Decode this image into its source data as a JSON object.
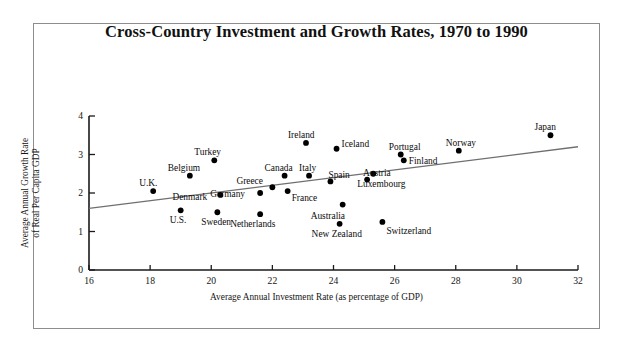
{
  "figure": {
    "title": "Cross-Country Investment and Growth Rates, 1970 to 1990"
  },
  "chart_data": {
    "type": "scatter",
    "title": "Cross-Country Investment and Growth Rates, 1970 to 1990",
    "xlabel": "Average Annual Investment Rate (as percentage of GDP)",
    "ylabel": "Average Annual Growth Rate of Real Per Capita GDP",
    "ylabel_line1": "Average Annual Growth Rate",
    "ylabel_line2": "of Real Per Capita GDP",
    "xlim": [
      16,
      32
    ],
    "ylim": [
      0,
      4
    ],
    "xticks": [
      16,
      18,
      20,
      22,
      24,
      26,
      28,
      30,
      32
    ],
    "yticks": [
      0,
      1,
      2,
      3,
      4
    ],
    "grid": false,
    "legend": "none",
    "trendline": {
      "x": [
        16,
        32
      ],
      "y": [
        1.6,
        3.2
      ]
    },
    "points": [
      {
        "label": "U.K.",
        "x": 18.1,
        "y": 2.05,
        "label_dx": -14,
        "label_dy": -13
      },
      {
        "label": "U.S.",
        "x": 19.0,
        "y": 1.55,
        "label_dx": -11,
        "label_dy": 5
      },
      {
        "label": "Belgium",
        "x": 19.3,
        "y": 2.45,
        "label_dx": -22,
        "label_dy": -13
      },
      {
        "label": "Denmark",
        "x": 20.3,
        "y": 1.95,
        "label_dx": -48,
        "label_dy": -3
      },
      {
        "label": "Sweden",
        "x": 20.2,
        "y": 1.5,
        "label_dx": -16,
        "label_dy": 5
      },
      {
        "label": "Turkey",
        "x": 20.1,
        "y": 2.85,
        "label_dx": -20,
        "label_dy": -13
      },
      {
        "label": "Germany",
        "x": 21.6,
        "y": 2.0,
        "label_dx": -50,
        "label_dy": -4
      },
      {
        "label": "Greece",
        "x": 22.0,
        "y": 2.15,
        "label_dx": -36,
        "label_dy": -11
      },
      {
        "label": "Netherlands",
        "x": 21.6,
        "y": 1.45,
        "label_dx": -30,
        "label_dy": 5
      },
      {
        "label": "Canada",
        "x": 22.4,
        "y": 2.45,
        "label_dx": -20,
        "label_dy": -13
      },
      {
        "label": "France",
        "x": 22.5,
        "y": 2.05,
        "label_dx": 4,
        "label_dy": 2
      },
      {
        "label": "Italy",
        "x": 23.2,
        "y": 2.45,
        "label_dx": -10,
        "label_dy": -13
      },
      {
        "label": "Spain",
        "x": 23.9,
        "y": 2.3,
        "label_dx": -2,
        "label_dy": -11
      },
      {
        "label": "Ireland",
        "x": 23.1,
        "y": 3.3,
        "label_dx": -18,
        "label_dy": -13
      },
      {
        "label": "Iceland",
        "x": 24.1,
        "y": 3.15,
        "label_dx": 5,
        "label_dy": -10
      },
      {
        "label": "New Zealand",
        "x": 24.2,
        "y": 1.2,
        "label_dx": -28,
        "label_dy": 5
      },
      {
        "label": "Australia",
        "x": 24.3,
        "y": 1.7,
        "label_dx": -32,
        "label_dy": 6
      },
      {
        "label": "Austria",
        "x": 25.1,
        "y": 2.35,
        "label_dx": -4,
        "label_dy": -12
      },
      {
        "label": "Luxembourg",
        "x": 25.3,
        "y": 2.5,
        "label_dx": -16,
        "label_dy": 5
      },
      {
        "label": "Switzerland",
        "x": 25.6,
        "y": 1.25,
        "label_dx": 4,
        "label_dy": 4
      },
      {
        "label": "Portugal",
        "x": 26.2,
        "y": 3.0,
        "label_dx": -12,
        "label_dy": -13
      },
      {
        "label": "Finland",
        "x": 26.3,
        "y": 2.85,
        "label_dx": 5,
        "label_dy": -4
      },
      {
        "label": "Norway",
        "x": 28.1,
        "y": 3.1,
        "label_dx": -13,
        "label_dy": -13
      },
      {
        "label": "Japan",
        "x": 31.1,
        "y": 3.5,
        "label_dx": -16,
        "label_dy": -13
      }
    ]
  }
}
